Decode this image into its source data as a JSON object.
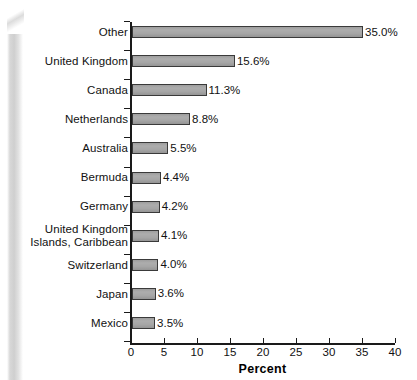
{
  "figure": {
    "background_color": "#ffffff",
    "bar_fill_color": "#a6a6a6",
    "bar_border_color": "#3a3a3a",
    "axis_color": "#1a1a1a",
    "text_color": "#111111"
  },
  "chart_data": {
    "type": "bar",
    "orientation": "horizontal",
    "title": "",
    "subtitle": "",
    "xlabel": "Percent",
    "ylabel": "",
    "xlim": [
      0,
      40
    ],
    "xticks": [
      0,
      5,
      10,
      15,
      20,
      25,
      30,
      35,
      40
    ],
    "xtick_labels": [
      "0",
      "5",
      "10",
      "15",
      "20",
      "25",
      "30",
      "35",
      "40"
    ],
    "grid": false,
    "legend": null,
    "categories": [
      "Other",
      "United Kingdom",
      "Canada",
      "Netherlands",
      "Australia",
      "Bermuda",
      "Germany",
      "United Kingdom Islands, Caribbean",
      "Switzerland",
      "Japan",
      "Mexico"
    ],
    "category_label_lines": [
      [
        "Other"
      ],
      [
        "United Kingdom"
      ],
      [
        "Canada"
      ],
      [
        "Netherlands"
      ],
      [
        "Australia"
      ],
      [
        "Bermuda"
      ],
      [
        "Germany"
      ],
      [
        "United Kingdom",
        "Islands, Caribbean"
      ],
      [
        "Switzerland"
      ],
      [
        "Japan"
      ],
      [
        "Mexico"
      ]
    ],
    "values": [
      35.0,
      15.6,
      11.3,
      8.8,
      5.5,
      4.4,
      4.2,
      4.1,
      4.0,
      3.6,
      3.5
    ],
    "value_labels": [
      "35.0%",
      "15.6%",
      "11.3%",
      "8.8%",
      "5.5%",
      "4.4%",
      "4.2%",
      "4.1%",
      "4.0%",
      "3.6%",
      "3.5%"
    ]
  },
  "axis": {
    "x_title": "Percent"
  }
}
